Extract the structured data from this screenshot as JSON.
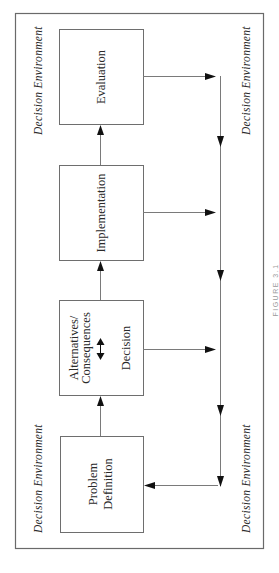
{
  "diagram": {
    "type": "process-flow",
    "orientation": "rotated-90-ccw",
    "environment_label": "Decision Environment",
    "environment_labels": [
      {
        "position": "top-left",
        "text": "Decision Environment"
      },
      {
        "position": "top-right",
        "text": "Decision Environment"
      },
      {
        "position": "bottom-left",
        "text": "Decision Environment"
      },
      {
        "position": "bottom-right",
        "text": "Decision Environment"
      }
    ],
    "boxes": [
      {
        "id": "problem-definition",
        "lines": [
          "Problem",
          "Definition"
        ]
      },
      {
        "id": "alternatives-decision",
        "lines": [
          "Alternatives/",
          "Consequences",
          "Decision"
        ],
        "inner_arrow": "double-headed"
      },
      {
        "id": "implementation",
        "lines": [
          "Implementation"
        ]
      },
      {
        "id": "evaluation",
        "lines": [
          "Evaluation"
        ]
      }
    ],
    "edges": [
      {
        "from": "problem-definition",
        "to": "alternatives-decision"
      },
      {
        "from": "alternatives-decision",
        "to": "implementation"
      },
      {
        "from": "implementation",
        "to": "evaluation"
      },
      {
        "from": "evaluation",
        "to": "feedback-line"
      },
      {
        "from": "implementation",
        "to": "feedback-line"
      },
      {
        "from": "alternatives-decision",
        "to": "feedback-line"
      },
      {
        "from": "feedback-line",
        "to": "problem-definition"
      }
    ],
    "caption": "FIGURE 3.1",
    "colors": {
      "stroke": "#6e6e6e",
      "arrowhead": "#111111",
      "text": "#2a2a2a",
      "background": "#ffffff"
    }
  }
}
